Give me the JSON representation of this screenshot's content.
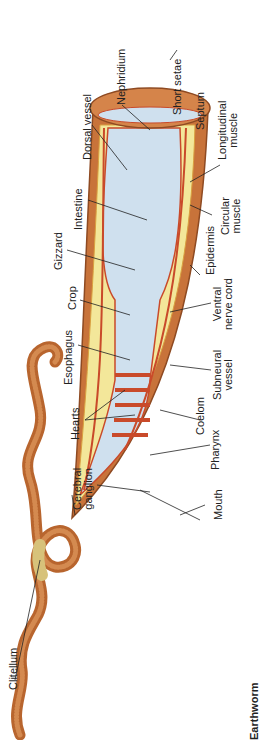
{
  "title": "Earthworm",
  "colors": {
    "skin": "#c8733a",
    "skin_dark": "#8e4a22",
    "skin_light": "#e0a06a",
    "yellow": "#f3e79a",
    "gut": "#cfe0ee",
    "vessel": "#c94a2a",
    "line": "#222222"
  },
  "labels": {
    "nephridium": "Nephridium",
    "dorsal_vessel": "Dorsal vessel",
    "short_setae": "Short setae",
    "septum": "Septum",
    "longitudinal_muscle_1": "Longitudinal",
    "longitudinal_muscle_2": "muscle",
    "intestine": "Intestine",
    "circular_muscle_1": "Circular",
    "circular_muscle_2": "muscle",
    "gizzard": "Gizzard",
    "epidermis": "Epidermis",
    "crop": "Crop",
    "ventral_nerve_cord_1": "Ventral",
    "ventral_nerve_cord_2": "nerve cord",
    "esophagus": "Esophagus",
    "subneural_vessel_1": "Subneural",
    "subneural_vessel_2": "vessel",
    "hearts": "Hearts",
    "coelom": "Coelom",
    "pharynx": "Pharynx",
    "cerebral_ganglion_1": "Cerebral",
    "cerebral_ganglion_2": "ganglion",
    "mouth": "Mouth",
    "clitellum": "Clitellum"
  }
}
